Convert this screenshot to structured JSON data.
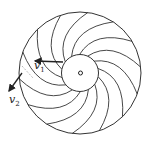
{
  "diagram": {
    "center_label": "o",
    "blade_count": 14,
    "vectors": [
      {
        "name": "v1",
        "symbol": "v",
        "subscript": "1"
      },
      {
        "name": "v2",
        "symbol": "v",
        "subscript": "2"
      }
    ],
    "colors": {
      "stroke": "#333333",
      "background": "#ffffff"
    }
  }
}
